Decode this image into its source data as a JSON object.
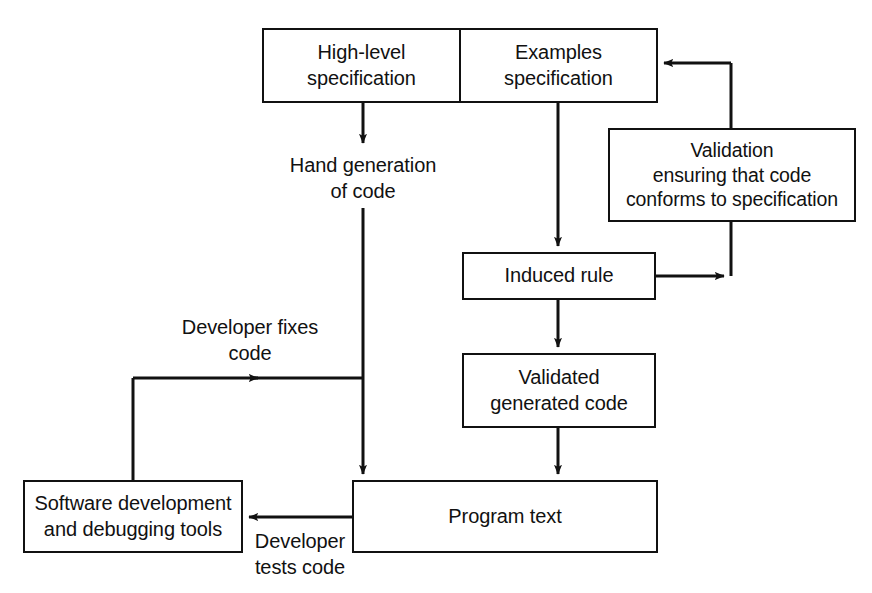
{
  "diagram": {
    "stroke_color": "#111111",
    "background": "#ffffff",
    "nodes": [
      {
        "id": "high-level-specification",
        "label": "High-level\nspecification",
        "x": 262,
        "y": 28,
        "w": 201,
        "h": 75
      },
      {
        "id": "examples-specification",
        "label": "Examples\nspecification",
        "x": 463,
        "y": 28,
        "w": 195,
        "h": 75
      },
      {
        "id": "validation",
        "label": "Validation\nensuring that code\nconforms to specification",
        "x": 608,
        "y": 128,
        "w": 248,
        "h": 94
      },
      {
        "id": "induced-rule",
        "label": "Induced rule",
        "x": 462,
        "y": 252,
        "w": 194,
        "h": 48
      },
      {
        "id": "validated-generated-code",
        "label": "Validated\ngenerated code",
        "x": 462,
        "y": 353,
        "w": 194,
        "h": 75
      },
      {
        "id": "program-text",
        "label": "Program text",
        "x": 352,
        "y": 480,
        "w": 306,
        "h": 73
      },
      {
        "id": "software-development-and-debugging-tools",
        "label": "Software development\nand debugging tools",
        "x": 23,
        "y": 480,
        "w": 220,
        "h": 73
      }
    ],
    "edge_labels": [
      {
        "id": "hand-generation-of-code",
        "label": "Hand generation\nof code",
        "x": 265,
        "y": 152,
        "w": 196
      },
      {
        "id": "developer-fixes-code",
        "label": "Developer fixes\ncode",
        "x": 152,
        "y": 314,
        "w": 196
      },
      {
        "id": "developer-tests-code",
        "label": "Developer\ntests code",
        "x": 248,
        "y": 528,
        "w": 104
      }
    ],
    "edges": [
      {
        "id": "high-level-spec-to-hand-generation",
        "from": "high-level-specification",
        "to": "hand-generation-of-code",
        "arrow": true
      },
      {
        "id": "hand-generation-to-program-text",
        "from": "hand-generation-of-code",
        "to": "program-text",
        "arrow": true
      },
      {
        "id": "examples-spec-to-induced-rule",
        "from": "examples-specification",
        "to": "induced-rule",
        "arrow": true
      },
      {
        "id": "induced-rule-to-validation",
        "from": "induced-rule",
        "to": "validation",
        "arrow": true
      },
      {
        "id": "validation-to-examples-spec",
        "from": "validation",
        "to": "examples-specification",
        "arrow": true
      },
      {
        "id": "induced-rule-to-validated-generated-code",
        "from": "induced-rule",
        "to": "validated-generated-code",
        "arrow": true
      },
      {
        "id": "validated-generated-code-to-program-text",
        "from": "validated-generated-code",
        "to": "program-text",
        "arrow": true
      },
      {
        "id": "program-text-to-software-tools",
        "from": "program-text",
        "to": "software-development-and-debugging-tools",
        "arrow": true
      },
      {
        "id": "software-tools-to-program-text-feedback",
        "from": "software-development-and-debugging-tools",
        "to": "program-text",
        "arrow": true
      }
    ]
  }
}
